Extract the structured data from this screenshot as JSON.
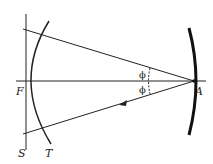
{
  "diagram": {
    "labels": {
      "F": "F",
      "A": "A",
      "S": "S",
      "T": "T",
      "phi_upper": "ϕ",
      "phi_lower": "ϕ"
    },
    "colors": {
      "stroke": "#222222",
      "background": "#ffffff"
    }
  }
}
